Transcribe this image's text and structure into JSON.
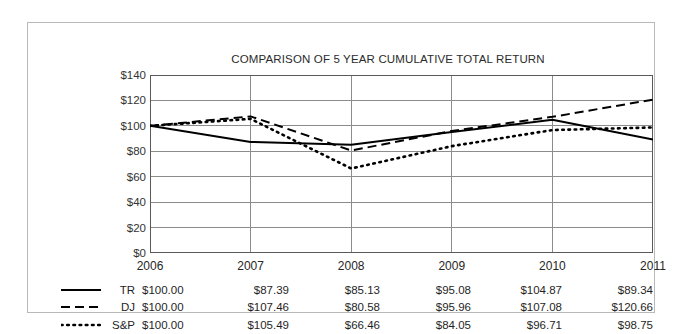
{
  "chart_data": {
    "type": "line",
    "title": "COMPARISON OF 5 YEAR CUMULATIVE TOTAL RETURN",
    "xlabel": "",
    "ylabel": "",
    "categories": [
      "2006",
      "2007",
      "2008",
      "2009",
      "2010",
      "2011"
    ],
    "ylim": [
      0,
      140
    ],
    "yticks": [
      "$0",
      "$20",
      "$40",
      "$60",
      "$80",
      "$100",
      "$120",
      "$140"
    ],
    "ytick_values": [
      0,
      20,
      40,
      60,
      80,
      100,
      120,
      140
    ],
    "grid": true,
    "legend_position": "bottom-table",
    "series": [
      {
        "name": "TR",
        "style": "solid",
        "color": "#000000",
        "values": [
          100.0,
          87.39,
          85.13,
          95.08,
          104.87,
          89.34
        ],
        "labels": [
          "$100.00",
          "$87.39",
          "$85.13",
          "$95.08",
          "$104.87",
          "$89.34"
        ]
      },
      {
        "name": "DJ",
        "style": "dashed",
        "color": "#000000",
        "values": [
          100.0,
          107.46,
          80.58,
          95.96,
          107.08,
          120.66
        ],
        "labels": [
          "$100.00",
          "$107.46",
          "$80.58",
          "$95.96",
          "$107.08",
          "$120.66"
        ]
      },
      {
        "name": "S&P",
        "style": "dotted",
        "color": "#000000",
        "values": [
          100.0,
          105.49,
          66.46,
          84.05,
          96.71,
          98.75
        ],
        "labels": [
          "$100.00",
          "$105.49",
          "$66.46",
          "$84.05",
          "$96.71",
          "$98.75"
        ]
      }
    ]
  },
  "style": {
    "grid_color": "#8c8c8c",
    "axis_color": "#5a5a5a",
    "frame_color": "#b9b9b9",
    "text_color": "#1f1f1f",
    "background": "#ffffff"
  }
}
